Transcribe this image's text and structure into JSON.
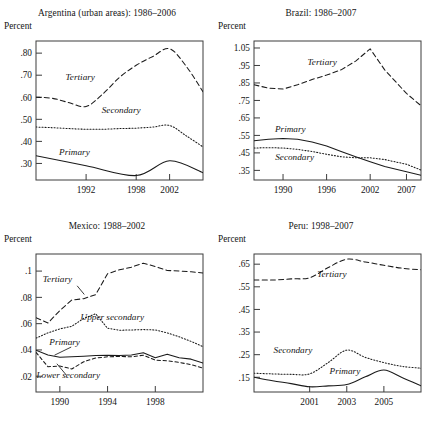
{
  "figure": {
    "width": 428,
    "height": 425,
    "background": "#ffffff",
    "ink_color": "#1a1a1a"
  },
  "panels": [
    {
      "id": "argentina",
      "title": "Argentina (urban areas): 1986–2006",
      "ylabel": "Percent"
    },
    {
      "id": "brazil",
      "title": "Brazil: 1986–2007",
      "ylabel": "Percent"
    },
    {
      "id": "mexico",
      "title": "Mexico: 1988–2002",
      "ylabel": "Percent"
    },
    {
      "id": "peru",
      "title": "Peru: 1998–2007",
      "ylabel": "Percent"
    }
  ],
  "chart_data": [
    {
      "id": "argentina",
      "type": "line",
      "title": "Argentina (urban areas): 1986–2006",
      "xlabel": "",
      "ylabel": "Percent",
      "xlim": [
        1986,
        2006
      ],
      "ylim": [
        0.225,
        0.855
      ],
      "xticks": [
        1992,
        1998,
        2002
      ],
      "xticklabels": [
        "1992",
        "1998",
        "2002"
      ],
      "yticks": [
        0.3,
        0.4,
        0.5,
        0.6,
        0.7,
        0.8
      ],
      "yticklabels": [
        ".30",
        ".40",
        ".50",
        ".60",
        ".70",
        ".80"
      ],
      "grid": false,
      "legend": "inline-annotations",
      "series": [
        {
          "name": "Tertiary",
          "style": "dashed",
          "x": [
            1986,
            1988,
            1990,
            1992,
            1994,
            1996,
            1998,
            2000,
            2002,
            2004,
            2006
          ],
          "values": [
            0.6,
            0.595,
            0.575,
            0.558,
            0.615,
            0.69,
            0.745,
            0.785,
            0.82,
            0.74,
            0.625
          ]
        },
        {
          "name": "Secondary",
          "style": "dotted",
          "x": [
            1986,
            1988,
            1990,
            1992,
            1994,
            1996,
            1998,
            2000,
            2002,
            2004,
            2006
          ],
          "values": [
            0.465,
            0.462,
            0.458,
            0.455,
            0.455,
            0.458,
            0.46,
            0.465,
            0.472,
            0.425,
            0.375
          ]
        },
        {
          "name": "Primary",
          "style": "solid",
          "x": [
            1986,
            1992,
            1998,
            2002,
            2006
          ],
          "values": [
            0.335,
            0.29,
            0.245,
            0.312,
            0.258
          ]
        }
      ]
    },
    {
      "id": "brazil",
      "type": "line",
      "title": "Brazil: 1986–2007",
      "xlabel": "",
      "ylabel": "Percent",
      "xlim": [
        1986,
        2009
      ],
      "ylim": [
        0.295,
        1.09
      ],
      "xticks": [
        1990,
        1996,
        2002,
        2007
      ],
      "xticklabels": [
        "1990",
        "1996",
        "2002",
        "2007"
      ],
      "yticks": [
        0.35,
        0.45,
        0.55,
        0.65,
        0.75,
        0.85,
        0.95,
        1.05
      ],
      "yticklabels": [
        ".35",
        ".45",
        ".55",
        ".65",
        ".75",
        ".85",
        ".95",
        "1.05"
      ],
      "grid": false,
      "legend": "inline-annotations",
      "series": [
        {
          "name": "Tertiary",
          "style": "dashed",
          "x": [
            1986,
            1988,
            1990,
            1992,
            1994,
            1996,
            1998,
            2000,
            2002,
            2004,
            2007,
            2009
          ],
          "values": [
            0.84,
            0.82,
            0.815,
            0.84,
            0.87,
            0.895,
            0.925,
            0.975,
            1.045,
            0.925,
            0.79,
            0.72
          ]
        },
        {
          "name": "Primary",
          "style": "solid",
          "x": [
            1986,
            1988,
            1990,
            1992,
            1994,
            1996,
            1998,
            2000,
            2002,
            2004,
            2007,
            2009
          ],
          "values": [
            0.52,
            0.528,
            0.532,
            0.528,
            0.512,
            0.49,
            0.458,
            0.428,
            0.4,
            0.372,
            0.342,
            0.322
          ]
        },
        {
          "name": "Secondary",
          "style": "dotted",
          "x": [
            1986,
            1988,
            1990,
            1992,
            1994,
            1996,
            1998,
            2000,
            2002,
            2004,
            2007,
            2009
          ],
          "values": [
            0.478,
            0.48,
            0.478,
            0.47,
            0.458,
            0.442,
            0.428,
            0.422,
            0.422,
            0.412,
            0.385,
            0.352
          ]
        }
      ]
    },
    {
      "id": "mexico",
      "type": "line",
      "title": "Mexico: 1988–2002",
      "xlabel": "",
      "ylabel": "Percent",
      "xlim": [
        1988,
        2002
      ],
      "ylim": [
        0.008,
        0.113
      ],
      "xticks": [
        1990,
        1994,
        1998
      ],
      "xticklabels": [
        "1990",
        "1994",
        "1998"
      ],
      "yticks": [
        0.02,
        0.04,
        0.06,
        0.08,
        0.1
      ],
      "yticklabels": [
        ".02",
        ".04",
        ".06",
        ".08",
        ".1"
      ],
      "grid": false,
      "legend": "inline-annotations",
      "series": [
        {
          "name": "Tertiary",
          "style": "dashed",
          "x": [
            1988,
            1989,
            1990,
            1991,
            1992,
            1993,
            1994,
            1995,
            1996,
            1997,
            1998,
            1999,
            2000,
            2001,
            2002
          ],
          "values": [
            0.0645,
            0.0605,
            0.07,
            0.078,
            0.079,
            0.082,
            0.098,
            0.101,
            0.103,
            0.106,
            0.1035,
            0.1005,
            0.1,
            0.0995,
            0.0985
          ]
        },
        {
          "name": "Upper secondary",
          "style": "dotted",
          "x": [
            1988,
            1989,
            1990,
            1991,
            1992,
            1993,
            1994,
            1995,
            1996,
            1997,
            1998,
            1999,
            2000,
            2001,
            2002
          ],
          "values": [
            0.049,
            0.053,
            0.056,
            0.058,
            0.064,
            0.0675,
            0.0565,
            0.055,
            0.0552,
            0.0555,
            0.0552,
            0.053,
            0.05,
            0.0465,
            0.0425
          ]
        },
        {
          "name": "Primary",
          "style": "solid",
          "x": [
            1988,
            1989,
            1990,
            1991,
            1992,
            1993,
            1994,
            1995,
            1996,
            1997,
            1998,
            1999,
            2000,
            2001,
            2002
          ],
          "values": [
            0.0398,
            0.0362,
            0.0345,
            0.0348,
            0.0352,
            0.0358,
            0.036,
            0.0358,
            0.0362,
            0.0378,
            0.034,
            0.0368,
            0.034,
            0.033,
            0.03
          ]
        },
        {
          "name": "Lower secondary",
          "style": "dashed-short",
          "x": [
            1988,
            1989,
            1990,
            1991,
            1992,
            1993,
            1994,
            1995,
            1996,
            1997,
            1998,
            1999,
            2000,
            2001,
            2002
          ],
          "values": [
            0.0382,
            0.0272,
            0.0278,
            0.0255,
            0.031,
            0.0338,
            0.0348,
            0.035,
            0.0348,
            0.036,
            0.0322,
            0.0318,
            0.0305,
            0.0288,
            0.0262
          ]
        }
      ]
    },
    {
      "id": "peru",
      "type": "line",
      "title": "Peru: 1998–2007",
      "xlabel": "",
      "ylabel": "Percent",
      "xlim": [
        1998,
        2007
      ],
      "ylim": [
        0.085,
        0.695
      ],
      "xticks": [
        2001,
        2003,
        2005
      ],
      "xticklabels": [
        "2001",
        "2003",
        "2005"
      ],
      "yticks": [
        0.15,
        0.25,
        0.35,
        0.45,
        0.55,
        0.65
      ],
      "yticklabels": [
        ".15",
        ".25",
        ".35",
        ".45",
        ".55",
        ".65"
      ],
      "grid": false,
      "legend": "inline-annotations",
      "series": [
        {
          "name": "Tertiary",
          "style": "dashed",
          "x": [
            1998,
            1999,
            2000,
            2001,
            2002,
            2003,
            2004,
            2005,
            2006,
            2007
          ],
          "values": [
            0.58,
            0.58,
            0.585,
            0.59,
            0.635,
            0.672,
            0.66,
            0.645,
            0.632,
            0.625
          ]
        },
        {
          "name": "Secondary",
          "style": "dotted",
          "x": [
            1998,
            1999,
            2000,
            2001,
            2002,
            2003,
            2004,
            2005,
            2006,
            2007
          ],
          "values": [
            0.168,
            0.165,
            0.163,
            0.165,
            0.215,
            0.27,
            0.238,
            0.215,
            0.198,
            0.19
          ]
        },
        {
          "name": "Primary",
          "style": "solid",
          "x": [
            1998,
            1999,
            2000,
            2001,
            2002,
            2003,
            2004,
            2005,
            2006,
            2007
          ],
          "values": [
            0.15,
            0.135,
            0.122,
            0.108,
            0.112,
            0.118,
            0.152,
            0.182,
            0.148,
            0.112
          ]
        }
      ]
    }
  ],
  "annotations": {
    "argentina": [
      {
        "text": "Tertiary",
        "x": 1991.3,
        "y": 0.678
      },
      {
        "text": "Secondary",
        "x": 1996.2,
        "y": 0.528
      },
      {
        "text": "Primary",
        "x": 1990.6,
        "y": 0.34
      }
    ],
    "brazil": [
      {
        "text": "Tertiary",
        "x": 1995.4,
        "y": 0.955
      },
      {
        "text": "Primary",
        "x": 1991.0,
        "y": 0.57
      },
      {
        "text": "Secondary",
        "x": 1991.6,
        "y": 0.412
      }
    ],
    "mexico": [
      {
        "text": "Tertiary",
        "x": 1989.8,
        "y": 0.0918
      },
      {
        "text": "Upper secondary",
        "x": 1994.4,
        "y": 0.0625
      },
      {
        "text": "Primary",
        "x": 1990.4,
        "y": 0.0438
      },
      {
        "text": "Lower secondary",
        "x": 1990.7,
        "y": 0.0188
      }
    ],
    "peru": [
      {
        "text": "Tertiary",
        "x": 2002.2,
        "y": 0.592
      },
      {
        "text": "Secondary",
        "x": 2000.1,
        "y": 0.258
      },
      {
        "text": "Primary",
        "x": 2002.9,
        "y": 0.165
      }
    ]
  },
  "leaders": {
    "mexico": [
      {
        "from": [
          1991.45,
          0.0888
        ],
        "to": [
          1992.05,
          0.0822
        ]
      },
      {
        "from": [
          1990.95,
          0.0422
        ],
        "to": [
          1989.55,
          0.036
        ]
      },
      {
        "from": [
          1990.55,
          0.0208
        ],
        "to": [
          1989.75,
          0.0295
        ]
      }
    ]
  }
}
